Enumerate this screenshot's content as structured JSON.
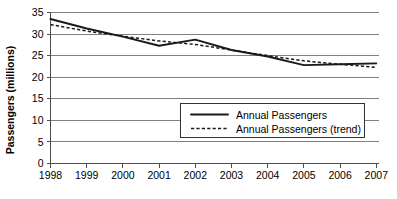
{
  "chart_data": {
    "type": "line",
    "title": "",
    "xlabel": "",
    "ylabel": "Passengers (millions)",
    "categories": [
      "1998",
      "1999",
      "2000",
      "2001",
      "2002",
      "2003",
      "2004",
      "2005",
      "2006",
      "2007"
    ],
    "x": [
      1998,
      1999,
      2000,
      2001,
      2002,
      2003,
      2004,
      2005,
      2006,
      2007
    ],
    "series": [
      {
        "name": "Annual Passengers",
        "style": "solid",
        "color": "#1a1a1a",
        "values": [
          33.5,
          31.3,
          29.4,
          27.3,
          28.7,
          26.3,
          24.8,
          22.8,
          23.0,
          23.2
        ]
      },
      {
        "name": "Annual Passengers (trend)",
        "style": "dashed",
        "color": "#1a1a1a",
        "values": [
          32.2,
          30.7,
          29.5,
          28.4,
          27.6,
          26.3,
          25.0,
          23.8,
          23.0,
          22.3
        ]
      }
    ],
    "ylim": [
      0,
      35
    ],
    "yticks": [
      0,
      5,
      10,
      15,
      20,
      25,
      30,
      35
    ],
    "ytick_labels": [
      "0",
      "5",
      "10",
      "15",
      "20",
      "25",
      "30",
      "35"
    ],
    "grid": true,
    "grid_axis": "y",
    "legend_position": "center-right-lower",
    "legend_entries": [
      "Annual Passengers",
      "Annual Passengers (trend)"
    ]
  },
  "legend": {
    "items": [
      {
        "label": "Annual Passengers",
        "style": "solid"
      },
      {
        "label": "Annual Passengers (trend)",
        "style": "dashed"
      }
    ]
  },
  "colors": {
    "background": "#ffffff",
    "gridline": "#808080",
    "axis": "#4d4d4d",
    "series": "#1a1a1a",
    "legend_border": "#333333"
  }
}
